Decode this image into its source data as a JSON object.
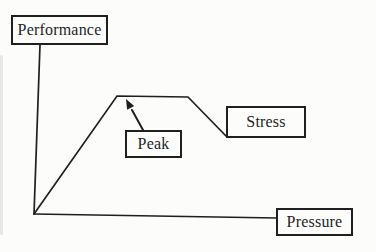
{
  "figure": {
    "background": "#fcfcfb",
    "ink": "#1f1f1f",
    "labels": {
      "performance": "Performance",
      "peak": "Peak",
      "stress": "Stress",
      "pressure": "Pressure"
    }
  }
}
